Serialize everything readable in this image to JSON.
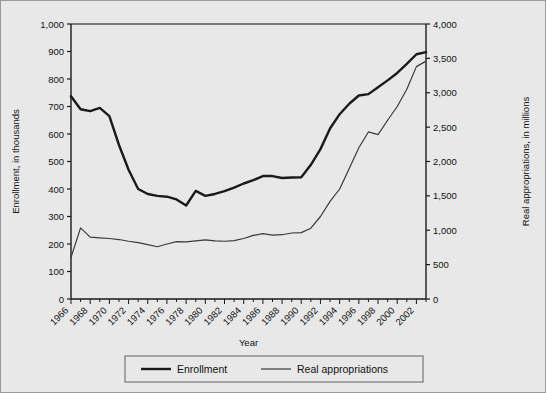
{
  "figure": {
    "background_color": "#e8e8e8",
    "border_color": "#9a9a9a",
    "plot_background_color": "#e8e8e8",
    "axis_color": "#1a1a1a"
  },
  "chart_data": {
    "type": "line",
    "title": "",
    "xlabel": "Year",
    "ylabel": "Enrollment, in thousands",
    "y2label": "Real appropriations, in millions",
    "xlim": [
      1966,
      2003
    ],
    "ylim": [
      0,
      1000
    ],
    "y2lim": [
      0,
      4000
    ],
    "grid": false,
    "legend_position": "bottom-center",
    "x_tick_labels": [
      "1966",
      "1968",
      "1970",
      "1972",
      "1974",
      "1976",
      "1978",
      "1980",
      "1982",
      "1984",
      "1986",
      "1988",
      "1990",
      "1992",
      "1994",
      "1996",
      "1998",
      "2000",
      "2002"
    ],
    "x_tick_step": 2,
    "x_minor_tick_step": 1,
    "y_tick_labels": [
      "0",
      "100",
      "200",
      "300",
      "400",
      "500",
      "600",
      "700",
      "800",
      "900",
      "1,000"
    ],
    "y2_tick_labels": [
      "0",
      "500",
      "1,000",
      "1,500",
      "2,000",
      "2,500",
      "3,000",
      "3,500",
      "4,000"
    ],
    "x": [
      1966,
      1967,
      1968,
      1969,
      1970,
      1971,
      1972,
      1973,
      1974,
      1975,
      1976,
      1977,
      1978,
      1979,
      1980,
      1981,
      1982,
      1983,
      1984,
      1985,
      1986,
      1987,
      1988,
      1989,
      1990,
      1991,
      1992,
      1993,
      1994,
      1995,
      1996,
      1997,
      1998,
      1999,
      2000,
      2001,
      2002,
      2003
    ],
    "series": [
      {
        "name": "Enrollment",
        "axis": "left",
        "units": "thousands",
        "line_width": 2.4,
        "color": "#1a1a1a",
        "values": [
          737,
          690,
          683,
          695,
          665,
          560,
          470,
          400,
          382,
          375,
          372,
          362,
          340,
          393,
          375,
          382,
          392,
          405,
          420,
          432,
          447,
          447,
          440,
          442,
          443,
          488,
          545,
          620,
          672,
          710,
          740,
          745,
          770,
          795,
          822,
          855,
          890,
          898
        ]
      },
      {
        "name": "Real appropriations",
        "axis": "right",
        "units": "millions",
        "line_width": 1.2,
        "color": "#3a3a3a",
        "values": [
          605,
          1035,
          900,
          890,
          880,
          865,
          840,
          820,
          790,
          760,
          800,
          835,
          830,
          845,
          860,
          845,
          840,
          850,
          880,
          925,
          950,
          930,
          935,
          960,
          965,
          1030,
          1200,
          1420,
          1600,
          1900,
          2200,
          2430,
          2390,
          2600,
          2800,
          3050,
          3380,
          3460
        ]
      }
    ],
    "legend": [
      {
        "label": "Enrollment",
        "line_width": 2.4,
        "color": "#1a1a1a"
      },
      {
        "label": "Real appropriations",
        "line_width": 1.2,
        "color": "#3a3a3a"
      }
    ]
  }
}
